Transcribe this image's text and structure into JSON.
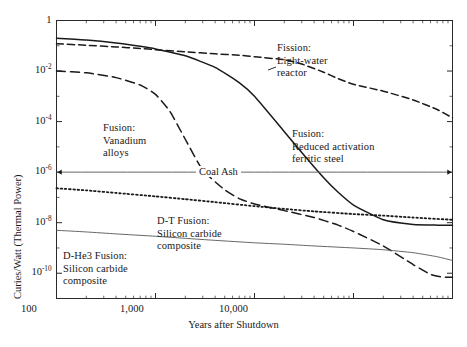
{
  "chart_data": {
    "type": "line",
    "title": "",
    "xlabel": "Years after Shutdown",
    "ylabel": "Curies/Watt (Thermal Power)",
    "xscale": "log",
    "yscale": "log",
    "xlim": [
      1,
      10000
    ],
    "ylim": [
      1e-11,
      1
    ],
    "grid": false,
    "legend": "annotations-inline",
    "xticks": [
      "1",
      "10",
      "100",
      "1,000",
      "10,000"
    ],
    "xtick_values": [
      1,
      10,
      100,
      1000,
      10000
    ],
    "yticks": [
      "1",
      "10-2",
      "10-4",
      "10-6",
      "10-8",
      "10-10"
    ],
    "ytick_values": [
      1,
      0.01,
      0.0001,
      1e-06,
      1e-08,
      1e-10
    ],
    "ytick_mantissa": [
      "1",
      "10",
      "10",
      "10",
      "10",
      "10"
    ],
    "ytick_exponent": [
      "",
      "-2",
      "-4",
      "-6",
      "-8",
      "-10"
    ],
    "series": [
      {
        "name": "Fission: Light-water reactor",
        "style": "dashed",
        "label_lines": [
          "Fission:",
          "Light-water",
          "reactor"
        ],
        "points": [
          [
            1,
            0.12
          ],
          [
            2,
            0.105
          ],
          [
            4,
            0.09
          ],
          [
            7,
            0.078
          ],
          [
            10,
            0.07
          ],
          [
            20,
            0.058
          ],
          [
            40,
            0.048
          ],
          [
            70,
            0.042
          ],
          [
            100,
            0.037
          ],
          [
            200,
            0.028
          ],
          [
            300,
            0.019
          ],
          [
            500,
            0.009
          ],
          [
            700,
            0.005
          ],
          [
            1000,
            0.003
          ],
          [
            2000,
            0.0016
          ],
          [
            4000,
            0.00072
          ],
          [
            7000,
            0.0003
          ],
          [
            10000,
            0.00014
          ]
        ]
      },
      {
        "name": "Fusion: Reduced activation ferritic steel",
        "style": "solid",
        "label_lines": [
          "Fusion:",
          "Reduced activation",
          "ferritic steel"
        ],
        "points": [
          [
            1,
            0.2
          ],
          [
            2,
            0.17
          ],
          [
            4,
            0.13
          ],
          [
            7,
            0.095
          ],
          [
            10,
            0.075
          ],
          [
            20,
            0.04
          ],
          [
            40,
            0.014
          ],
          [
            70,
            0.0035
          ],
          [
            100,
            0.001
          ],
          [
            200,
            4e-05
          ],
          [
            300,
            6e-06
          ],
          [
            500,
            6e-07
          ],
          [
            700,
            1.6e-07
          ],
          [
            1000,
            5e-08
          ],
          [
            2000,
            1.3e-08
          ],
          [
            4000,
            8.5e-09
          ],
          [
            7000,
            8e-09
          ],
          [
            10000,
            8e-09
          ]
        ]
      },
      {
        "name": "Fusion: Vanadium alloys",
        "style": "dashed-long",
        "label_lines": [
          "Fusion:",
          "Vanadium",
          "alloys"
        ],
        "points": [
          [
            1,
            0.01
          ],
          [
            2,
            0.0085
          ],
          [
            4,
            0.0055
          ],
          [
            7,
            0.0028
          ],
          [
            10,
            0.0012
          ],
          [
            14,
            0.00025
          ],
          [
            20,
            2e-05
          ],
          [
            30,
            1.2e-06
          ],
          [
            50,
            2e-07
          ],
          [
            70,
            9e-08
          ],
          [
            100,
            5.5e-08
          ],
          [
            200,
            3e-08
          ],
          [
            400,
            1.6e-08
          ],
          [
            700,
            8e-09
          ],
          [
            1000,
            4.5e-09
          ],
          [
            2000,
            1.2e-09
          ],
          [
            4000,
            2.2e-10
          ],
          [
            6000,
            9e-11
          ],
          [
            8000,
            7e-11
          ],
          [
            10000,
            7e-11
          ]
        ]
      },
      {
        "name": "D-T Fusion: Silicon carbide composite",
        "style": "dotted",
        "label_lines": [
          "D-T Fusion:",
          "Silicon carbide",
          "composite"
        ],
        "points": [
          [
            1,
            2.3e-07
          ],
          [
            2,
            1.9e-07
          ],
          [
            4,
            1.5e-07
          ],
          [
            10,
            1.1e-07
          ],
          [
            20,
            8.5e-08
          ],
          [
            40,
            6.5e-08
          ],
          [
            100,
            4.5e-08
          ],
          [
            200,
            3.5e-08
          ],
          [
            400,
            2.8e-08
          ],
          [
            1000,
            2.2e-08
          ],
          [
            2000,
            1.9e-08
          ],
          [
            4000,
            1.6e-08
          ],
          [
            10000,
            1.3e-08
          ]
        ]
      },
      {
        "name": "D-He3 Fusion: Silicon carbide composite",
        "style": "solid-thin",
        "label_lines": [
          "D-He3 Fusion:",
          "Silicon carbide",
          "composite"
        ],
        "points": [
          [
            1,
            5e-09
          ],
          [
            2,
            4.3e-09
          ],
          [
            4,
            3.6e-09
          ],
          [
            10,
            2.9e-09
          ],
          [
            20,
            2.4e-09
          ],
          [
            40,
            2e-09
          ],
          [
            100,
            1.6e-09
          ],
          [
            200,
            1.4e-09
          ],
          [
            400,
            1.2e-09
          ],
          [
            1000,
            1e-09
          ],
          [
            2000,
            8.5e-10
          ],
          [
            4000,
            6.5e-10
          ],
          [
            7000,
            4.5e-10
          ],
          [
            10000,
            3.2e-10
          ]
        ]
      },
      {
        "name": "Coal Ash",
        "style": "solid-thin-reference",
        "label_lines": [
          "Coal Ash"
        ],
        "value": 1e-06,
        "points": [
          [
            1,
            1e-06
          ],
          [
            10000,
            1e-06
          ]
        ]
      }
    ],
    "annotations": [
      {
        "key": "fission",
        "text": "Fission: Light-water reactor"
      },
      {
        "key": "ferritic",
        "text": "Fusion: Reduced activation ferritic steel"
      },
      {
        "key": "vanadium",
        "text": "Fusion: Vanadium alloys"
      },
      {
        "key": "dt",
        "text": "D-T Fusion: Silicon carbide composite"
      },
      {
        "key": "dhe3",
        "text": "D-He3 Fusion: Silicon carbide composite"
      },
      {
        "key": "coal",
        "text": "Coal Ash"
      }
    ]
  },
  "axes": {
    "x": {
      "label": "Years after Shutdown",
      "ticks": [
        {
          "text": "1"
        },
        {
          "text": "10"
        },
        {
          "text": "100"
        },
        {
          "text": "1,000"
        },
        {
          "text": "10,000"
        }
      ]
    },
    "y": {
      "label": "Curies/Watt (Thermal Power)",
      "ticks": [
        {
          "mantissa": "1",
          "exp": ""
        },
        {
          "mantissa": "10",
          "exp": "-2"
        },
        {
          "mantissa": "10",
          "exp": "-4"
        },
        {
          "mantissa": "10",
          "exp": "-6"
        },
        {
          "mantissa": "10",
          "exp": "-8"
        },
        {
          "mantissa": "10",
          "exp": "-10"
        }
      ]
    }
  },
  "annotations": {
    "fission": {
      "l1": "Fission:",
      "l2": "Light-water",
      "l3": "reactor"
    },
    "vanadium": {
      "l1": "Fusion:",
      "l2": "Vanadium",
      "l3": "alloys"
    },
    "ferritic": {
      "l1": "Fusion:",
      "l2": "Reduced activation",
      "l3": "ferritic steel"
    },
    "dt": {
      "l1": "D-T Fusion:",
      "l2": "Silicon carbide",
      "l3": "composite"
    },
    "dhe3": {
      "l1": "D-He3 Fusion:",
      "l2": "Silicon carbide",
      "l3": "composite"
    },
    "coal": {
      "l1": "Coal Ash"
    }
  },
  "colors": {
    "line": "#1a1a1a",
    "axis": "#2a2a2a",
    "background": "#ffffff",
    "thin": "#555555"
  }
}
